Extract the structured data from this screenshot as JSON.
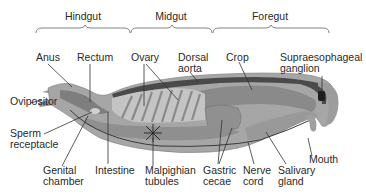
{
  "diagram": {
    "regions": [
      {
        "id": "hindgut",
        "label": "Hindgut",
        "x": 83,
        "y": 12
      },
      {
        "id": "midgut",
        "label": "Midgut",
        "x": 171,
        "y": 12
      },
      {
        "id": "foregut",
        "label": "Foregut",
        "x": 270,
        "y": 12
      }
    ],
    "labels": {
      "anus": {
        "line1": "Anus"
      },
      "rectum": {
        "line1": "Rectum"
      },
      "ovary": {
        "line1": "Ovary"
      },
      "dorsal_aorta": {
        "line1": "Dorsal",
        "line2": "aorta"
      },
      "crop": {
        "line1": "Crop"
      },
      "supraesophageal_ganglion": {
        "line1": "Supraesophageal",
        "line2": "ganglion"
      },
      "ovipositor": {
        "line1": "Ovipositor"
      },
      "sperm_receptacle": {
        "line1": "Sperm",
        "line2": "receptacle"
      },
      "genital_chamber": {
        "line1": "Genital",
        "line2": "chamber"
      },
      "intestine": {
        "line1": "Intestine"
      },
      "malpighian_tubules": {
        "line1": "Malpighian",
        "line2": "tubules"
      },
      "gastric_cecae": {
        "line1": "Gastric",
        "line2": "cecae"
      },
      "nerve_cord": {
        "line1": "Nerve",
        "line2": "cord"
      },
      "salivary_gland": {
        "line1": "Salivary",
        "line2": "gland"
      },
      "mouth": {
        "line1": "Mouth"
      }
    },
    "colors": {
      "body_outer": "#a9a9a9",
      "body_mid": "#8c8c8c",
      "body_dark": "#5e5e5e",
      "organ_light": "#cfcfcf",
      "line": "#333333",
      "text": "#2a2a2a"
    }
  }
}
